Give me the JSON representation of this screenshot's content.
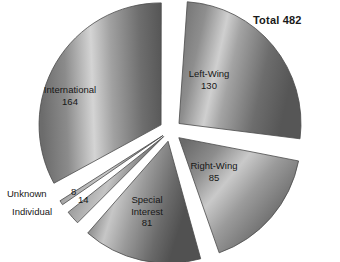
{
  "title": "Total 482",
  "total": 482,
  "chart_data": {
    "type": "pie",
    "title": "Total 482",
    "xlabel": "",
    "ylabel": "",
    "total": 482,
    "grid": false,
    "legend": "none",
    "labels_position": "inside-and-outside",
    "exploded": true,
    "categories": [
      "Left-Wing",
      "Right-Wing",
      "Special Interest",
      "Individual",
      "Unknown",
      "International"
    ],
    "values": [
      130,
      85,
      81,
      14,
      8,
      164
    ],
    "slices": [
      {
        "name": "Left-Wing",
        "label": "Left-Wing",
        "value": 130,
        "value_text": "130",
        "percent": 27.0,
        "start_angle": 2.0,
        "end_angle": 99.1,
        "label_placement": "inside",
        "label_x": 209,
        "label_y": 68
      },
      {
        "name": "Right-Wing",
        "label": "Right-Wing",
        "value": 85,
        "value_text": "85",
        "percent": 17.6,
        "start_angle": 102.5,
        "end_angle": 166.0,
        "label_placement": "inside",
        "label_x": 214,
        "label_y": 160
      },
      {
        "name": "Special Interest",
        "label_line1": "Special",
        "label_line2": "Interest",
        "value": 81,
        "value_text": "81",
        "percent": 16.8,
        "start_angle": 169.5,
        "end_angle": 230.0,
        "label_placement": "inside",
        "label_x": 147,
        "label_y": 194
      },
      {
        "name": "Individual",
        "label": "Individual",
        "value": 14,
        "value_text": "14",
        "percent": 2.9,
        "start_angle": 233.5,
        "end_angle": 244.0,
        "label_placement": "outside",
        "label_x": 12,
        "label_y": 206,
        "value_x": 78,
        "value_y": 194
      },
      {
        "name": "Unknown",
        "label": "Unknown",
        "value": 8,
        "value_text": "8",
        "percent": 1.7,
        "start_angle": 247.5,
        "end_angle": 253.5,
        "label_placement": "outside",
        "label_x": 7,
        "label_y": 188,
        "value_x": 71,
        "value_y": 186
      },
      {
        "name": "International",
        "label": "International",
        "value": 164,
        "value_text": "164",
        "percent": 34.0,
        "start_angle": 257.0,
        "end_angle": 358.5,
        "label_placement": "inside",
        "label_x": 70,
        "label_y": 84
      }
    ]
  },
  "colors": {
    "background": "#ffffff",
    "slice_dark": "#5a5a5a",
    "slice_mid": "#8a8a8a",
    "slice_light": "#d2d2d2",
    "slice_edge": "#4a4a4a",
    "text": "#171717",
    "gap": "#ffffff"
  }
}
